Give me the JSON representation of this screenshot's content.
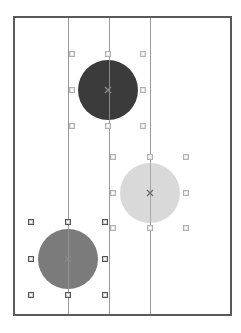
{
  "canvas": {
    "frame_color": "#5a5a5a",
    "background": "#ffffff",
    "guide_lines_x": [
      53,
      94,
      135
    ]
  },
  "shapes": [
    {
      "name": "dark-circle",
      "type": "circle",
      "cx": 93,
      "cy": 72,
      "r": 30,
      "fill": "#3b3b3b",
      "selected": false,
      "handles": [
        [
          57,
          36
        ],
        [
          93,
          36
        ],
        [
          128,
          36
        ],
        [
          57,
          72
        ],
        [
          128,
          72
        ],
        [
          57,
          108
        ],
        [
          93,
          108
        ],
        [
          128,
          108
        ]
      ],
      "center_mark_color": "#8a8a8a"
    },
    {
      "name": "light-circle",
      "type": "circle",
      "cx": 135,
      "cy": 175,
      "r": 30,
      "fill": "#d9d9d9",
      "selected": false,
      "handles": [
        [
          98,
          139
        ],
        [
          135,
          139
        ],
        [
          171,
          139
        ],
        [
          98,
          175
        ],
        [
          171,
          175
        ],
        [
          98,
          210
        ],
        [
          135,
          210
        ],
        [
          171,
          210
        ]
      ],
      "center_mark_color": "#6a6a6a"
    },
    {
      "name": "medium-circle",
      "type": "circle",
      "cx": 53,
      "cy": 241,
      "r": 30,
      "fill": "#7b7b7b",
      "selected": true,
      "handles": [
        [
          16,
          204
        ],
        [
          53,
          204
        ],
        [
          90,
          204
        ],
        [
          16,
          241
        ],
        [
          90,
          241
        ],
        [
          16,
          277
        ],
        [
          53,
          277
        ],
        [
          90,
          277
        ]
      ],
      "center_mark_color": "#8a8a8a"
    }
  ]
}
